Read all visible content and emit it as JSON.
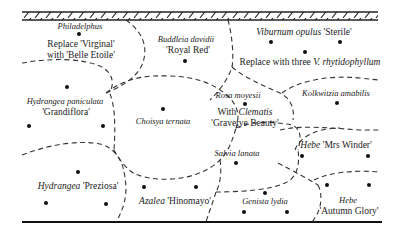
{
  "diagram": {
    "type": "shrub-border planting plan",
    "top_edge": "wall (hatched)",
    "bottom_edge": "border edge (solid line)",
    "plants": [
      {
        "id": "philadelphus",
        "name_italic": "Philadelphus",
        "line2": "Replace 'Virginal'",
        "line3": "with 'Belle Etoile'"
      },
      {
        "id": "buddleia",
        "name_italic": "Buddleia davidii",
        "line2": "'Royal Red'"
      },
      {
        "id": "viburnum",
        "name_italic": "Viburnum opulus",
        "name_cultivar": "'Sterile'",
        "line2_plain": "Replace with three",
        "line2_italic": "V. rhytidophyllum"
      },
      {
        "id": "hydrangea-paniculata",
        "name_italic": "Hydrangea paniculata",
        "line2": "'Grandiflora'"
      },
      {
        "id": "choisya",
        "name_italic": "Choisya ternata"
      },
      {
        "id": "rosa",
        "name_italic": "Rosa moyesii",
        "line2_plain": "With",
        "line2_italic": "Clematis",
        "line3": "'Gravetye Beauty'"
      },
      {
        "id": "kolkwitzia",
        "name_italic": "Kolkwitzia amabilis"
      },
      {
        "id": "salvia",
        "name_italic": "Salvia lanata"
      },
      {
        "id": "hebe-mrs-winder",
        "name_italic": "Hebe",
        "name_cultivar": "'Mrs Winder'"
      },
      {
        "id": "hydrangea-preziosa",
        "name_italic": "Hydrangea",
        "name_cultivar": "'Preziosa'"
      },
      {
        "id": "azalea",
        "name_italic": "Azalea",
        "name_cultivar": "'Hinomayo'"
      },
      {
        "id": "genista",
        "name_italic": "Genista lydia"
      },
      {
        "id": "hebe-autumn-glory",
        "name_italic": "Hebe",
        "line2": "'Autumn Glory'"
      }
    ]
  }
}
